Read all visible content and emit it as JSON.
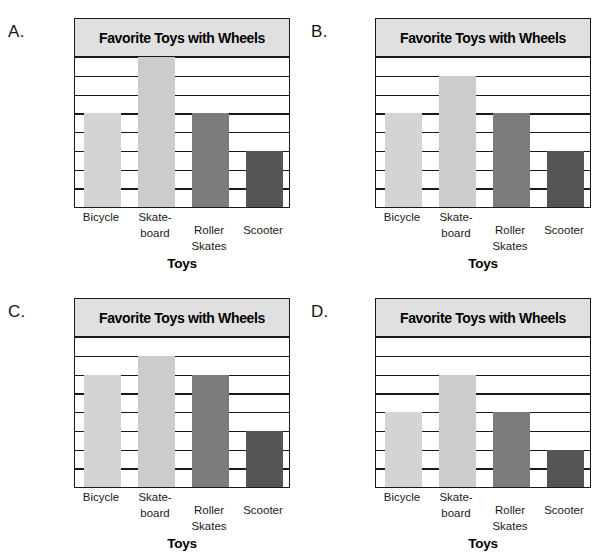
{
  "page": {
    "background": "#ffffff",
    "width": 607,
    "height": 559
  },
  "common": {
    "title": "Favorite Toys with Wheels",
    "ylabel": "Number of students",
    "xlabel": "Toys",
    "categories": [
      "Bicycle",
      "Skate-board",
      "Roller Skates",
      "Scooter"
    ],
    "category_lines": [
      [
        "Bicycle"
      ],
      [
        "Skate-",
        "board"
      ],
      [
        "Roller",
        "Skates"
      ],
      [
        "Scooter"
      ]
    ],
    "ytick_labels": [
      "0",
      "1",
      "2",
      "3",
      "4",
      "5",
      "6",
      "7",
      "8"
    ],
    "ylim": [
      0,
      8
    ],
    "bar_colors": [
      "#d4d4d4",
      "#cccccc",
      "#7c7c7c",
      "#555555"
    ],
    "title_box_fill": "#e0e0e0",
    "axis_color": "#1a1a1a"
  },
  "panels": [
    {
      "letter": "A.",
      "values": [
        5,
        8,
        5,
        3
      ]
    },
    {
      "letter": "B.",
      "values": [
        5,
        7,
        5,
        3
      ]
    },
    {
      "letter": "C.",
      "values": [
        6,
        7,
        6,
        3
      ]
    },
    {
      "letter": "D.",
      "values": [
        4,
        6,
        4,
        2
      ]
    }
  ],
  "chart_data": [
    {
      "type": "bar",
      "panel": "A.",
      "title": "Favorite Toys with Wheels",
      "xlabel": "Toys",
      "ylabel": "Number of students",
      "categories": [
        "Bicycle",
        "Skate-board",
        "Roller Skates",
        "Scooter"
      ],
      "values": [
        5,
        8,
        5,
        3
      ],
      "ylim": [
        0,
        8
      ],
      "yticks": [
        0,
        1,
        2,
        3,
        4,
        5,
        6,
        7,
        8
      ],
      "grid": true,
      "legend": "none"
    },
    {
      "type": "bar",
      "panel": "B.",
      "title": "Favorite Toys with Wheels",
      "xlabel": "Toys",
      "ylabel": "Number of students",
      "categories": [
        "Bicycle",
        "Skate-board",
        "Roller Skates",
        "Scooter"
      ],
      "values": [
        5,
        7,
        5,
        3
      ],
      "ylim": [
        0,
        8
      ],
      "yticks": [
        0,
        1,
        2,
        3,
        4,
        5,
        6,
        7,
        8
      ],
      "grid": true,
      "legend": "none"
    },
    {
      "type": "bar",
      "panel": "C.",
      "title": "Favorite Toys with Wheels",
      "xlabel": "Toys",
      "ylabel": "Number of students",
      "categories": [
        "Bicycle",
        "Skate-board",
        "Roller Skates",
        "Scooter"
      ],
      "values": [
        6,
        7,
        6,
        3
      ],
      "ylim": [
        0,
        8
      ],
      "yticks": [
        0,
        1,
        2,
        3,
        4,
        5,
        6,
        7,
        8
      ],
      "grid": true,
      "legend": "none"
    },
    {
      "type": "bar",
      "panel": "D.",
      "title": "Favorite Toys with Wheels",
      "xlabel": "Toys",
      "ylabel": "Number of students",
      "categories": [
        "Bicycle",
        "Skate-board",
        "Roller Skates",
        "Scooter"
      ],
      "values": [
        4,
        6,
        4,
        2
      ],
      "ylim": [
        0,
        8
      ],
      "yticks": [
        0,
        1,
        2,
        3,
        4,
        5,
        6,
        7,
        8
      ],
      "grid": true,
      "legend": "none"
    }
  ]
}
